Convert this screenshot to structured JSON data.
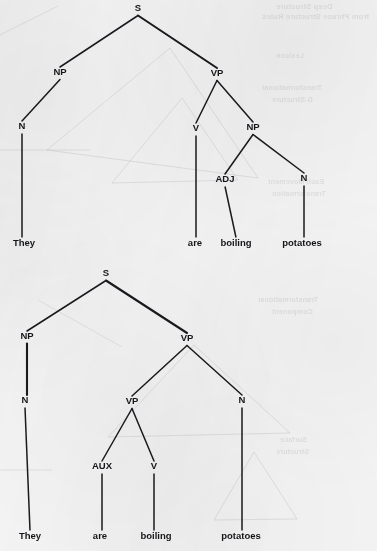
{
  "figure": {
    "kind": "syntax-tree-pair",
    "sentence": "They are boiling potatoes",
    "background_color": "#f3f3f3",
    "ink_color": "#191a1e"
  },
  "trees": [
    {
      "id": "tree-top",
      "reading": "They are boiling potatoes (progressive verb reading: 'are boiling' = V, 'potatoes' = NP)",
      "nodes": [
        {
          "id": "t-s",
          "label": "S",
          "x": 138,
          "y": 11,
          "role": "root"
        },
        {
          "id": "t-np1",
          "label": "NP",
          "x": 60,
          "y": 75,
          "role": "phrase"
        },
        {
          "id": "t-vp",
          "label": "VP",
          "x": 217,
          "y": 76,
          "role": "phrase"
        },
        {
          "id": "t-n1",
          "label": "N",
          "x": 22,
          "y": 129,
          "role": "pos"
        },
        {
          "id": "t-v",
          "label": "V",
          "x": 196,
          "y": 131,
          "role": "pos"
        },
        {
          "id": "t-np2",
          "label": "NP",
          "x": 253,
          "y": 130,
          "role": "phrase"
        },
        {
          "id": "t-adj",
          "label": "ADJ",
          "x": 225,
          "y": 182,
          "role": "pos"
        },
        {
          "id": "t-n2",
          "label": "N",
          "x": 304,
          "y": 181,
          "role": "pos"
        }
      ],
      "leaves": [
        {
          "id": "t-w1",
          "label": "They",
          "x": 24,
          "y": 246
        },
        {
          "id": "t-w2",
          "label": "are",
          "x": 195,
          "y": 246
        },
        {
          "id": "t-w3",
          "label": "boiling",
          "x": 236,
          "y": 246
        },
        {
          "id": "t-w4",
          "label": "potatoes",
          "x": 302,
          "y": 246
        }
      ],
      "edges": [
        {
          "from": "t-s",
          "to": "t-np1",
          "style": "branch"
        },
        {
          "from": "t-s",
          "to": "t-vp",
          "style": "branch-thick"
        },
        {
          "from": "t-np1",
          "to": "t-n1",
          "style": "branch"
        },
        {
          "from": "t-vp",
          "to": "t-v",
          "style": "branch"
        },
        {
          "from": "t-vp",
          "to": "t-np2",
          "style": "branch"
        },
        {
          "from": "t-np2",
          "to": "t-adj",
          "style": "branch"
        },
        {
          "from": "t-np2",
          "to": "t-n2",
          "style": "branch"
        },
        {
          "from": "t-n1",
          "to": "t-w1",
          "style": "stem"
        },
        {
          "from": "t-v",
          "to": "t-w2",
          "style": "stem"
        },
        {
          "from": "t-adj",
          "to": "t-w3",
          "style": "stem"
        },
        {
          "from": "t-n2",
          "to": "t-w4",
          "style": "stem"
        }
      ]
    },
    {
      "id": "tree-bottom",
      "reading": "They are boiling potatoes (adjectival reading: 'boiling' = ADJ modifying N 'potatoes')",
      "nodes": [
        {
          "id": "b-s",
          "label": "S",
          "x": 106,
          "y": 276,
          "role": "root"
        },
        {
          "id": "b-np",
          "label": "NP",
          "x": 27,
          "y": 339,
          "role": "phrase"
        },
        {
          "id": "b-vp1",
          "label": "VP",
          "x": 187,
          "y": 341,
          "role": "phrase"
        },
        {
          "id": "b-n1",
          "label": "N",
          "x": 25,
          "y": 403,
          "role": "pos"
        },
        {
          "id": "b-vp2",
          "label": "VP",
          "x": 132,
          "y": 404,
          "role": "phrase"
        },
        {
          "id": "b-n2",
          "label": "N",
          "x": 242,
          "y": 403,
          "role": "pos"
        },
        {
          "id": "b-aux",
          "label": "AUX",
          "x": 102,
          "y": 469,
          "role": "pos"
        },
        {
          "id": "b-v",
          "label": "V",
          "x": 154,
          "y": 469,
          "role": "pos"
        }
      ],
      "leaves": [
        {
          "id": "b-w1",
          "label": "They",
          "x": 30,
          "y": 539
        },
        {
          "id": "b-w2",
          "label": "are",
          "x": 100,
          "y": 539
        },
        {
          "id": "b-w3",
          "label": "boiling",
          "x": 156,
          "y": 539
        },
        {
          "id": "b-w4",
          "label": "potatoes",
          "x": 241,
          "y": 539
        }
      ],
      "edges": [
        {
          "from": "b-s",
          "to": "b-np",
          "style": "branch"
        },
        {
          "from": "b-s",
          "to": "b-vp1",
          "style": "branch-thick"
        },
        {
          "from": "b-np",
          "to": "b-n1",
          "style": "stem-thick"
        },
        {
          "from": "b-vp1",
          "to": "b-vp2",
          "style": "branch"
        },
        {
          "from": "b-vp1",
          "to": "b-n2",
          "style": "branch"
        },
        {
          "from": "b-vp2",
          "to": "b-aux",
          "style": "branch"
        },
        {
          "from": "b-vp2",
          "to": "b-v",
          "style": "branch"
        },
        {
          "from": "b-n1",
          "to": "b-w1",
          "style": "stem"
        },
        {
          "from": "b-aux",
          "to": "b-w2",
          "style": "stem"
        },
        {
          "from": "b-v",
          "to": "b-w3",
          "style": "stem"
        },
        {
          "from": "b-n2",
          "to": "b-w4",
          "style": "stem"
        }
      ]
    }
  ],
  "bleedthrough": [
    {
      "text": "Deep Structure",
      "x": 276,
      "y": 2,
      "size": 7.5
    },
    {
      "text": "from Phrase Structure Rules",
      "x": 262,
      "y": 12,
      "size": 7.5
    },
    {
      "text": "Lexicon",
      "x": 276,
      "y": 52,
      "size": 7
    },
    {
      "text": "Transformational",
      "x": 262,
      "y": 84,
      "size": 7
    },
    {
      "text": "D-Structure",
      "x": 272,
      "y": 96,
      "size": 7
    },
    {
      "text": "Each Movement",
      "x": 268,
      "y": 178,
      "size": 7
    },
    {
      "text": "Transformation",
      "x": 272,
      "y": 190,
      "size": 7
    },
    {
      "text": "Transformational",
      "x": 258,
      "y": 296,
      "size": 7
    },
    {
      "text": "Component",
      "x": 272,
      "y": 308,
      "size": 7
    },
    {
      "text": "Surface",
      "x": 280,
      "y": 436,
      "size": 7
    },
    {
      "text": "Structure",
      "x": 276,
      "y": 448,
      "size": 7
    }
  ]
}
